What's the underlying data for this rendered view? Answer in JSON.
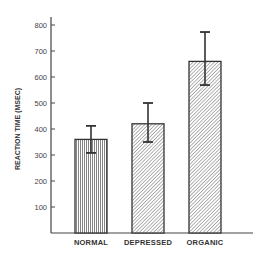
{
  "chart_data": {
    "type": "bar",
    "title": "",
    "xlabel": "",
    "ylabel": "REACTION TIME (MSEC)",
    "categories": [
      "NORMAL",
      "DEPRESSED",
      "ORGANIC"
    ],
    "values": [
      360,
      420,
      660
    ],
    "error_bars": [
      {
        "low": 308,
        "high": 412
      },
      {
        "low": 350,
        "high": 500
      },
      {
        "low": 569,
        "high": 773
      }
    ],
    "patterns": [
      "vertical-lines",
      "diagonal-hatch",
      "diagonal-hatch"
    ],
    "ylim": [
      0,
      850
    ],
    "yticks": [
      100,
      200,
      300,
      400,
      500,
      600,
      700,
      800
    ],
    "grid": false,
    "legend": "none"
  },
  "labels": {
    "ylabel": "REACTION TIME (MSEC)",
    "categories": [
      "NORMAL",
      "DEPRESSED",
      "ORGANIC"
    ],
    "yticks": [
      "100",
      "200",
      "300",
      "400",
      "500",
      "600",
      "700",
      "800"
    ]
  },
  "colors": {
    "bar_stroke": "#333333",
    "pattern": "#555555",
    "axis": "#444444"
  }
}
